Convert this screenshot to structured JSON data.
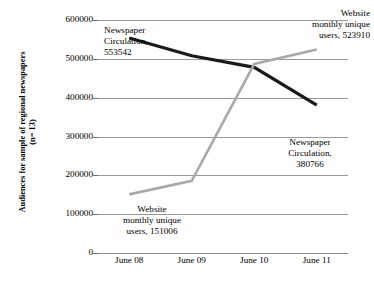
{
  "chart_data": {
    "type": "line",
    "title": "",
    "xlabel": "",
    "ylabel": "Audiences for sample of regional newspapers (n= 13)",
    "categories": [
      "June 08",
      "June 09",
      "June 10",
      "June 11"
    ],
    "ylim": [
      0,
      600000
    ],
    "yticks": [
      0,
      100000,
      200000,
      300000,
      400000,
      500000,
      600000
    ],
    "ytick_labels": [
      "0",
      "100000",
      "200000",
      "300000",
      "400000",
      "500000",
      "600000"
    ],
    "grid": true,
    "legend": "none",
    "series": [
      {
        "name": "Newspaper Circulation",
        "color": "#1a1a1a",
        "width": 3.2,
        "values": [
          553542,
          508000,
          478000,
          380766
        ]
      },
      {
        "name": "Website monthly unique users",
        "color": "#a9a9a9",
        "width": 2.6,
        "values": [
          151006,
          186000,
          487000,
          523910
        ]
      }
    ],
    "annotations": [
      {
        "id": "newspaper-start",
        "text": "Newspaper\nCirculation,\n553542",
        "value": 553542,
        "series": "Newspaper Circulation"
      },
      {
        "id": "website-end",
        "text": "Website\nmonthly unique\nusers, 523910",
        "value": 523910,
        "series": "Website monthly unique users"
      },
      {
        "id": "newspaper-end",
        "text": "Newspaper\nCirculation,\n380766",
        "value": 380766,
        "series": "Newspaper Circulation"
      },
      {
        "id": "website-start",
        "text": "Website\nmonthly unique\nusers, 151006",
        "value": 151006,
        "series": "Website monthly unique users"
      }
    ]
  },
  "axis": {
    "y_title": "Audiences for sample of regional newspapers\n(n= 13)"
  }
}
